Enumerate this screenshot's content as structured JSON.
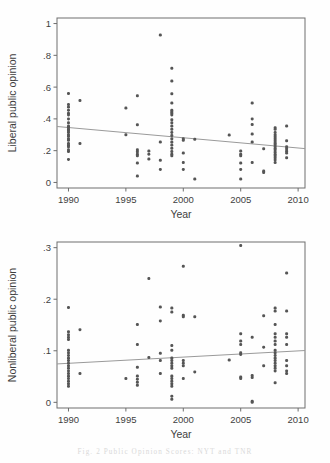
{
  "figure": {
    "caption": "Fig. 2   Public Opinion Scores: NYT and TNR",
    "background_color": "#fefefe",
    "point_color": "#555555",
    "line_color": "#9a9a9a",
    "frame_color": "#6e6e6e"
  },
  "chart_data": [
    {
      "id": "liberal",
      "type": "scatter",
      "title": "",
      "xlabel": "Year",
      "ylabel": "Liberal public opinion",
      "xlim": [
        1989.0,
        2010.6
      ],
      "ylim": [
        -0.035,
        1.035
      ],
      "xticks": [
        1990,
        1995,
        2000,
        2005,
        2010
      ],
      "xtick_labels": [
        "1990",
        "1995",
        "2000",
        "2005",
        "2010"
      ],
      "yticks": [
        0,
        0.2,
        0.4,
        0.6,
        0.8,
        1
      ],
      "ytick_labels": [
        "0",
        ".2",
        ".4",
        ".6",
        ".8",
        "1"
      ],
      "grid": false,
      "legend": "none",
      "trendline": {
        "x": [
          1989.0,
          2010.6
        ],
        "y": [
          0.352,
          0.213
        ]
      },
      "points": [
        [
          1990,
          0.56
        ],
        [
          1990,
          0.49
        ],
        [
          1990,
          0.475
        ],
        [
          1990,
          0.455
        ],
        [
          1990,
          0.435
        ],
        [
          1990,
          0.425
        ],
        [
          1990,
          0.4
        ],
        [
          1990,
          0.375
        ],
        [
          1990,
          0.355
        ],
        [
          1990,
          0.345
        ],
        [
          1990,
          0.335
        ],
        [
          1990,
          0.325
        ],
        [
          1990,
          0.315
        ],
        [
          1990,
          0.3
        ],
        [
          1990,
          0.29
        ],
        [
          1990,
          0.275
        ],
        [
          1990,
          0.265
        ],
        [
          1990,
          0.245
        ],
        [
          1990,
          0.235
        ],
        [
          1990,
          0.225
        ],
        [
          1990,
          0.205
        ],
        [
          1990,
          0.195
        ],
        [
          1990,
          0.145
        ],
        [
          1991,
          0.515
        ],
        [
          1991,
          0.245
        ],
        [
          1995,
          0.468
        ],
        [
          1995,
          0.3
        ],
        [
          1996,
          0.545
        ],
        [
          1996,
          0.363
        ],
        [
          1996,
          0.205
        ],
        [
          1996,
          0.193
        ],
        [
          1996,
          0.178
        ],
        [
          1996,
          0.168
        ],
        [
          1996,
          0.122
        ],
        [
          1996,
          0.04
        ],
        [
          1997,
          0.198
        ],
        [
          1997,
          0.178
        ],
        [
          1997,
          0.148
        ],
        [
          1998,
          0.928
        ],
        [
          1998,
          0.255
        ],
        [
          1998,
          0.14
        ],
        [
          1998,
          0.082
        ],
        [
          1999,
          0.718
        ],
        [
          1999,
          0.638
        ],
        [
          1999,
          0.558
        ],
        [
          1999,
          0.5
        ],
        [
          1999,
          0.455
        ],
        [
          1999,
          0.445
        ],
        [
          1999,
          0.435
        ],
        [
          1999,
          0.425
        ],
        [
          1999,
          0.395
        ],
        [
          1999,
          0.375
        ],
        [
          1999,
          0.355
        ],
        [
          1999,
          0.335
        ],
        [
          1999,
          0.315
        ],
        [
          1999,
          0.295
        ],
        [
          1999,
          0.275
        ],
        [
          1999,
          0.255
        ],
        [
          1999,
          0.235
        ],
        [
          1999,
          0.215
        ],
        [
          1999,
          0.195
        ],
        [
          1999,
          0.178
        ],
        [
          1999,
          0.168
        ],
        [
          2000,
          0.275
        ],
        [
          2000,
          0.265
        ],
        [
          2000,
          0.185
        ],
        [
          2000,
          0.125
        ],
        [
          2000,
          0.082
        ],
        [
          2001,
          0.272
        ],
        [
          2001,
          0.022
        ],
        [
          2004,
          0.298
        ],
        [
          2005,
          0.198
        ],
        [
          2005,
          0.178
        ],
        [
          2005,
          0.168
        ],
        [
          2005,
          0.122
        ],
        [
          2005,
          0.082
        ],
        [
          2005,
          0.022
        ],
        [
          2006,
          0.5
        ],
        [
          2006,
          0.4
        ],
        [
          2006,
          0.365
        ],
        [
          2006,
          0.305
        ],
        [
          2006,
          0.255
        ],
        [
          2006,
          0.125
        ],
        [
          2007,
          0.212
        ],
        [
          2007,
          0.072
        ],
        [
          2007,
          0.062
        ],
        [
          2008,
          0.345
        ],
        [
          2008,
          0.335
        ],
        [
          2008,
          0.315
        ],
        [
          2008,
          0.3
        ],
        [
          2008,
          0.288
        ],
        [
          2008,
          0.275
        ],
        [
          2008,
          0.262
        ],
        [
          2008,
          0.25
        ],
        [
          2008,
          0.24
        ],
        [
          2008,
          0.228
        ],
        [
          2008,
          0.215
        ],
        [
          2008,
          0.205
        ],
        [
          2008,
          0.192
        ],
        [
          2008,
          0.178
        ],
        [
          2008,
          0.168
        ],
        [
          2008,
          0.155
        ],
        [
          2008,
          0.142
        ],
        [
          2008,
          0.125
        ],
        [
          2009,
          0.355
        ],
        [
          2009,
          0.262
        ],
        [
          2009,
          0.225
        ],
        [
          2009,
          0.212
        ],
        [
          2009,
          0.198
        ],
        [
          2009,
          0.185
        ],
        [
          2009,
          0.155
        ]
      ]
    },
    {
      "id": "nonliberal",
      "type": "scatter",
      "title": "",
      "xlabel": "Year",
      "ylabel": "Nonliberal public opinion",
      "xlim": [
        1989.0,
        2010.6
      ],
      "ylim": [
        -0.011,
        0.311
      ],
      "xticks": [
        1990,
        1995,
        2000,
        2005,
        2010
      ],
      "xtick_labels": [
        "1990",
        "1995",
        "2000",
        "2005",
        "2010"
      ],
      "yticks": [
        0,
        0.1,
        0.2,
        0.3
      ],
      "ytick_labels": [
        "0",
        ".1",
        ".2",
        ".3"
      ],
      "grid": false,
      "legend": "none",
      "trendline": {
        "x": [
          1989.0,
          2010.6
        ],
        "y": [
          0.0745,
          0.1005
        ]
      },
      "points": [
        [
          1990,
          0.184
        ],
        [
          1990,
          0.137
        ],
        [
          1990,
          0.131
        ],
        [
          1990,
          0.126
        ],
        [
          1990,
          0.122
        ],
        [
          1990,
          0.101
        ],
        [
          1990,
          0.096
        ],
        [
          1990,
          0.091
        ],
        [
          1990,
          0.086
        ],
        [
          1990,
          0.081
        ],
        [
          1990,
          0.076
        ],
        [
          1990,
          0.071
        ],
        [
          1990,
          0.066
        ],
        [
          1990,
          0.061
        ],
        [
          1990,
          0.056
        ],
        [
          1990,
          0.051
        ],
        [
          1990,
          0.046
        ],
        [
          1990,
          0.041
        ],
        [
          1990,
          0.036
        ],
        [
          1990,
          0.031
        ],
        [
          1991,
          0.141
        ],
        [
          1991,
          0.056
        ],
        [
          1995,
          0.046
        ],
        [
          1996,
          0.151
        ],
        [
          1996,
          0.112
        ],
        [
          1996,
          0.068
        ],
        [
          1996,
          0.051
        ],
        [
          1996,
          0.045
        ],
        [
          1996,
          0.039
        ],
        [
          1996,
          0.033
        ],
        [
          1997,
          0.24
        ],
        [
          1997,
          0.087
        ],
        [
          1998,
          0.185
        ],
        [
          1998,
          0.158
        ],
        [
          1998,
          0.095
        ],
        [
          1998,
          0.081
        ],
        [
          1998,
          0.056
        ],
        [
          1999,
          0.183
        ],
        [
          1999,
          0.175
        ],
        [
          1999,
          0.11
        ],
        [
          1999,
          0.101
        ],
        [
          1999,
          0.086
        ],
        [
          1999,
          0.081
        ],
        [
          1999,
          0.076
        ],
        [
          1999,
          0.071
        ],
        [
          1999,
          0.066
        ],
        [
          1999,
          0.051
        ],
        [
          1999,
          0.046
        ],
        [
          1999,
          0.041
        ],
        [
          1999,
          0.036
        ],
        [
          1999,
          0.031
        ],
        [
          1999,
          0.012
        ],
        [
          1999,
          0.006
        ],
        [
          2000,
          0.264
        ],
        [
          2000,
          0.169
        ],
        [
          2000,
          0.166
        ],
        [
          2000,
          0.081
        ],
        [
          2000,
          0.076
        ],
        [
          2000,
          0.071
        ],
        [
          2000,
          0.046
        ],
        [
          2001,
          0.166
        ],
        [
          2001,
          0.059
        ],
        [
          2004,
          0.082
        ],
        [
          2005,
          0.304
        ],
        [
          2005,
          0.133
        ],
        [
          2005,
          0.119
        ],
        [
          2005,
          0.112
        ],
        [
          2005,
          0.096
        ],
        [
          2005,
          0.093
        ],
        [
          2005,
          0.049
        ],
        [
          2005,
          0.046
        ],
        [
          2006,
          0.126
        ],
        [
          2006,
          0.052
        ],
        [
          2006,
          0.048
        ],
        [
          2006,
          0.002
        ],
        [
          2006,
          0.0
        ],
        [
          2007,
          0.168
        ],
        [
          2007,
          0.107
        ],
        [
          2007,
          0.071
        ],
        [
          2008,
          0.183
        ],
        [
          2008,
          0.177
        ],
        [
          2008,
          0.151
        ],
        [
          2008,
          0.133
        ],
        [
          2008,
          0.126
        ],
        [
          2008,
          0.119
        ],
        [
          2008,
          0.112
        ],
        [
          2008,
          0.101
        ],
        [
          2008,
          0.096
        ],
        [
          2008,
          0.091
        ],
        [
          2008,
          0.086
        ],
        [
          2008,
          0.081
        ],
        [
          2008,
          0.076
        ],
        [
          2008,
          0.071
        ],
        [
          2008,
          0.066
        ],
        [
          2008,
          0.061
        ],
        [
          2008,
          0.038
        ],
        [
          2009,
          0.251
        ],
        [
          2009,
          0.177
        ],
        [
          2009,
          0.133
        ],
        [
          2009,
          0.126
        ],
        [
          2009,
          0.112
        ],
        [
          2009,
          0.081
        ],
        [
          2009,
          0.071
        ],
        [
          2009,
          0.061
        ],
        [
          2009,
          0.056
        ]
      ]
    }
  ]
}
